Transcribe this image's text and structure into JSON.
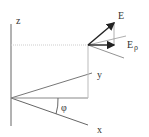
{
  "diagram": {
    "type": "vector-decomposition",
    "axes": {
      "z": {
        "label": "z"
      },
      "y": {
        "label": "y"
      },
      "x": {
        "label": "x"
      }
    },
    "angle": {
      "label": "φ"
    },
    "vectors": {
      "E": {
        "label": "E"
      },
      "E_rho": {
        "label": "E",
        "subscript": "ρ"
      }
    },
    "colors": {
      "axis": "#555555",
      "guide": "#bbbbbb",
      "vector": "#222222"
    }
  }
}
